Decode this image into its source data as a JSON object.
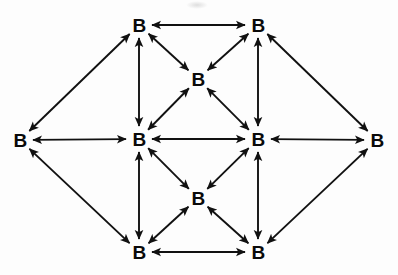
{
  "diagram": {
    "background_color": "#fdfdfd",
    "edge_color": "#111111",
    "node_text_color": "#0a0a0a",
    "node_label": "B",
    "edge_style": "double-headed arrow",
    "nodes": [
      {
        "id": "left",
        "label": "B",
        "x": 20,
        "y": 140
      },
      {
        "id": "top-left",
        "label": "B",
        "x": 139,
        "y": 25
      },
      {
        "id": "top-right",
        "label": "B",
        "x": 258,
        "y": 25
      },
      {
        "id": "upper-mid",
        "label": "B",
        "x": 198,
        "y": 79
      },
      {
        "id": "mid-left",
        "label": "B",
        "x": 139,
        "y": 139
      },
      {
        "id": "mid-right",
        "label": "B",
        "x": 258,
        "y": 139
      },
      {
        "id": "lower-mid",
        "label": "B",
        "x": 198,
        "y": 198
      },
      {
        "id": "bottom-left",
        "label": "B",
        "x": 139,
        "y": 252
      },
      {
        "id": "bottom-right",
        "label": "B",
        "x": 258,
        "y": 252
      },
      {
        "id": "right",
        "label": "B",
        "x": 377,
        "y": 140
      }
    ],
    "edges": [
      {
        "from": "left",
        "to": "top-left"
      },
      {
        "from": "left",
        "to": "mid-left"
      },
      {
        "from": "left",
        "to": "bottom-left"
      },
      {
        "from": "top-left",
        "to": "top-right"
      },
      {
        "from": "top-left",
        "to": "mid-left"
      },
      {
        "from": "top-left",
        "to": "upper-mid"
      },
      {
        "from": "top-right",
        "to": "upper-mid"
      },
      {
        "from": "top-right",
        "to": "mid-right"
      },
      {
        "from": "top-right",
        "to": "right"
      },
      {
        "from": "upper-mid",
        "to": "mid-left"
      },
      {
        "from": "upper-mid",
        "to": "mid-right"
      },
      {
        "from": "mid-left",
        "to": "mid-right"
      },
      {
        "from": "mid-left",
        "to": "lower-mid"
      },
      {
        "from": "mid-left",
        "to": "bottom-left"
      },
      {
        "from": "mid-right",
        "to": "lower-mid"
      },
      {
        "from": "mid-right",
        "to": "bottom-right"
      },
      {
        "from": "mid-right",
        "to": "right"
      },
      {
        "from": "lower-mid",
        "to": "bottom-left"
      },
      {
        "from": "lower-mid",
        "to": "bottom-right"
      },
      {
        "from": "bottom-left",
        "to": "bottom-right"
      },
      {
        "from": "bottom-right",
        "to": "right"
      }
    ]
  }
}
